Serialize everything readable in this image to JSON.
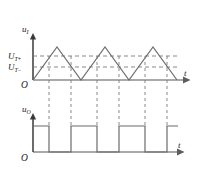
{
  "figure": {
    "background_color": "#ffffff",
    "wave_color": "#6b6b6b",
    "axis_color": "#8c8c8c",
    "dash_color": "#7a7a7a",
    "text_color": "#222222"
  },
  "upper_plot": {
    "name": "input-voltage-waveform",
    "y_axis_label": "u",
    "y_axis_label_sub": "I",
    "x_axis_label": "t",
    "origin_label": "O",
    "thresholds": [
      {
        "label": "U",
        "sub": "T",
        "sign": "+",
        "value_y": 56
      },
      {
        "label": "U",
        "sub": "T",
        "sign": "−",
        "value_y": 67
      }
    ]
  },
  "lower_plot": {
    "name": "output-voltage-waveform",
    "y_axis_label": "u",
    "y_axis_label_sub": "O",
    "x_axis_label": "t",
    "origin_label": "O"
  },
  "chart_data": {
    "type": "line",
    "subplots": [
      {
        "name": "input",
        "ylabel": "u_I",
        "xlabel": "t",
        "ylim": [
          0,
          52
        ],
        "xlim": [
          0,
          160
        ],
        "grid": false,
        "description": "Triangular (sawtooth-symmetric) input voltage waveform with three positive peaks",
        "threshold_lines": [
          {
            "name": "U_T+",
            "y": 24,
            "style": "dashed"
          },
          {
            "name": "U_T-",
            "y": 13,
            "style": "dashed"
          }
        ],
        "series": [
          {
            "name": "u_I",
            "x": [
              0,
              24,
              48,
              72,
              96,
              120,
              144,
              160
            ],
            "y": [
              0,
              33,
              0,
              33,
              0,
              33,
              0,
              0
            ],
            "shape": "triangle-wave"
          }
        ],
        "crossings": [
          {
            "x": 9,
            "direction": "rising",
            "threshold": "U_T-"
          },
          {
            "x": 17,
            "direction": "rising",
            "threshold": "U_T+"
          },
          {
            "x": 41,
            "direction": "falling",
            "threshold": "U_T+"
          },
          {
            "x": 57,
            "direction": "rising",
            "threshold": "U_T+"
          },
          {
            "x": 89,
            "direction": "falling",
            "threshold": "U_T+"
          },
          {
            "x": 105,
            "direction": "rising",
            "threshold": "U_T+"
          },
          {
            "x": 137,
            "direction": "falling",
            "threshold": "U_T+"
          }
        ]
      },
      {
        "name": "output",
        "ylabel": "u_O",
        "xlabel": "t",
        "ylim": [
          0,
          35
        ],
        "xlim": [
          0,
          160
        ],
        "grid": false,
        "description": "Square wave output voltage switching between high and low at threshold crossings",
        "series": [
          {
            "name": "u_O",
            "type": "square",
            "high_level": 27,
            "low_level": 0,
            "transitions": [
              {
                "x": 0,
                "level": "high"
              },
              {
                "x": 17,
                "level": "low"
              },
              {
                "x": 41,
                "level": "high"
              },
              {
                "x": 57,
                "level": "low"
              },
              {
                "x": 89,
                "level": "high"
              },
              {
                "x": 105,
                "level": "low"
              },
              {
                "x": 137,
                "level": "high"
              }
            ]
          }
        ]
      }
    ]
  }
}
